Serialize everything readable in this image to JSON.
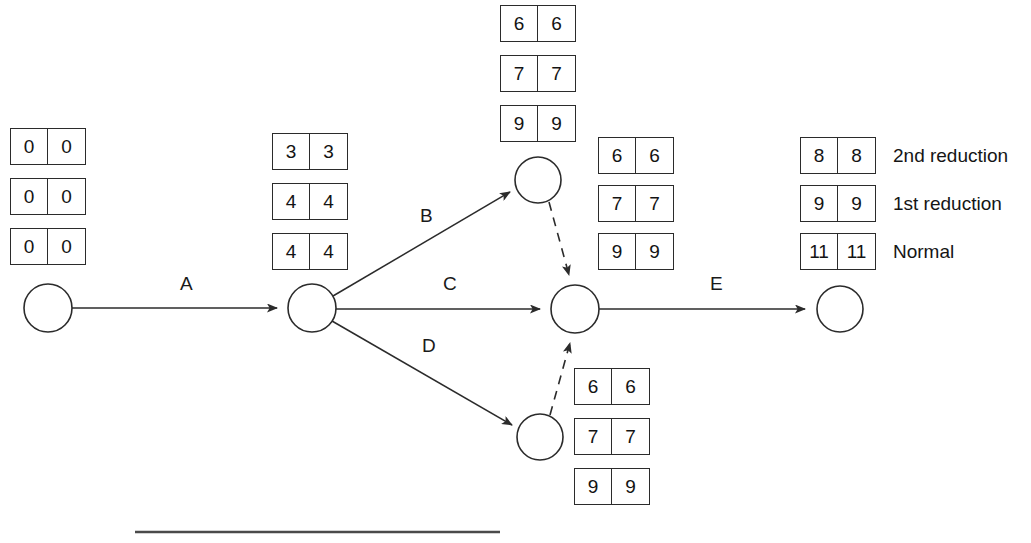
{
  "diagram": {
    "nodes": [
      {
        "id": "start",
        "label": "",
        "cx": 48,
        "cy": 308,
        "r": 24
      },
      {
        "id": "n2",
        "label": "",
        "cx": 312,
        "cy": 308,
        "r": 24
      },
      {
        "id": "n3_top",
        "label": "",
        "cx": 538,
        "cy": 180,
        "r": 23
      },
      {
        "id": "merge",
        "label": "",
        "cx": 575,
        "cy": 309,
        "r": 24
      },
      {
        "id": "n4_bot",
        "label": "",
        "cx": 540,
        "cy": 437,
        "r": 23
      },
      {
        "id": "end",
        "label": "",
        "cx": 840,
        "cy": 309,
        "r": 23
      }
    ],
    "edges": [
      {
        "id": "A",
        "label": "A",
        "from": "start",
        "to": "n2",
        "style": "solid",
        "label_x": 180,
        "label_y": 275
      },
      {
        "id": "B",
        "label": "B",
        "from": "n2",
        "to": "n3_top",
        "style": "solid",
        "label_x": 420,
        "label_y": 207
      },
      {
        "id": "C",
        "label": "C",
        "from": "n2",
        "to": "merge",
        "style": "solid",
        "label_x": 443,
        "label_y": 275
      },
      {
        "id": "D",
        "label": "D",
        "from": "n2",
        "to": "n4_bot",
        "style": "solid",
        "label_x": 422,
        "label_y": 337
      },
      {
        "id": "E",
        "label": "E",
        "from": "merge",
        "to": "end",
        "style": "solid",
        "label_x": 710,
        "label_y": 275
      },
      {
        "id": "dummy1",
        "label": "",
        "from": "n3_top",
        "to": "merge",
        "style": "dashed",
        "label_x": 0,
        "label_y": 0
      },
      {
        "id": "dummy2",
        "label": "",
        "from": "n4_bot",
        "to": "merge",
        "style": "dashed",
        "label_x": 0,
        "label_y": 0
      }
    ],
    "rule": {
      "x1": 135,
      "y1": 532,
      "x2": 500,
      "y2": 532
    }
  },
  "legend": {
    "rows": [
      {
        "label": "2nd reduction"
      },
      {
        "label": "1st reduction"
      },
      {
        "label": "Normal"
      }
    ]
  },
  "box_groups": [
    {
      "name": "start-node-times",
      "x": 10,
      "y": 128,
      "boxes": [
        {
          "left": "0",
          "right": "0"
        },
        {
          "left": "0",
          "right": "0"
        },
        {
          "left": "0",
          "right": "0"
        }
      ]
    },
    {
      "name": "node2-times",
      "x": 272,
      "y": 133,
      "boxes": [
        {
          "left": "3",
          "right": "3"
        },
        {
          "left": "4",
          "right": "4"
        },
        {
          "left": "4",
          "right": "4"
        }
      ]
    },
    {
      "name": "top-node-times",
      "x": 500,
      "y": 5,
      "boxes": [
        {
          "left": "6",
          "right": "6"
        },
        {
          "left": "7",
          "right": "7"
        },
        {
          "left": "9",
          "right": "9"
        }
      ]
    },
    {
      "name": "merge-node-times",
      "x": 598,
      "y": 137,
      "boxes": [
        {
          "left": "6",
          "right": "6"
        },
        {
          "left": "7",
          "right": "7"
        },
        {
          "left": "9",
          "right": "9"
        }
      ]
    },
    {
      "name": "bottom-node-times",
      "x": 574,
      "y": 368,
      "boxes": [
        {
          "left": "6",
          "right": "6"
        },
        {
          "left": "7",
          "right": "7"
        },
        {
          "left": "9",
          "right": "9"
        }
      ]
    },
    {
      "name": "end-node-times",
      "x": 800,
      "y": 137,
      "legend": true,
      "boxes": [
        {
          "left": "8",
          "right": "8"
        },
        {
          "left": "9",
          "right": "9"
        },
        {
          "left": "11",
          "right": "11"
        }
      ]
    }
  ],
  "colors": {
    "background": "#ffffff",
    "stroke": "#2b2b2b",
    "text": "#151515"
  }
}
